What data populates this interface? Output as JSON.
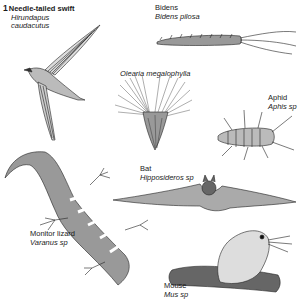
{
  "figure": {
    "number": "1",
    "specimens": [
      {
        "id": "swift",
        "common": "Needle-tailed swift",
        "scientific_line1": "Hirundapus",
        "scientific_line2": "caudacutus"
      },
      {
        "id": "bidens",
        "common": "Bidens",
        "scientific": "Bidens pilosa"
      },
      {
        "id": "olearia",
        "scientific": "Olearia megalophylla"
      },
      {
        "id": "aphid",
        "common": "Aphid",
        "scientific": "Aphis sp"
      },
      {
        "id": "bat",
        "common": "Bat",
        "scientific": "Hipposideros sp"
      },
      {
        "id": "lizard",
        "common": "Monitor lizard",
        "scientific": "Varanus sp"
      },
      {
        "id": "mouse",
        "common": "Mouse",
        "scientific": "Mus sp"
      }
    ]
  }
}
